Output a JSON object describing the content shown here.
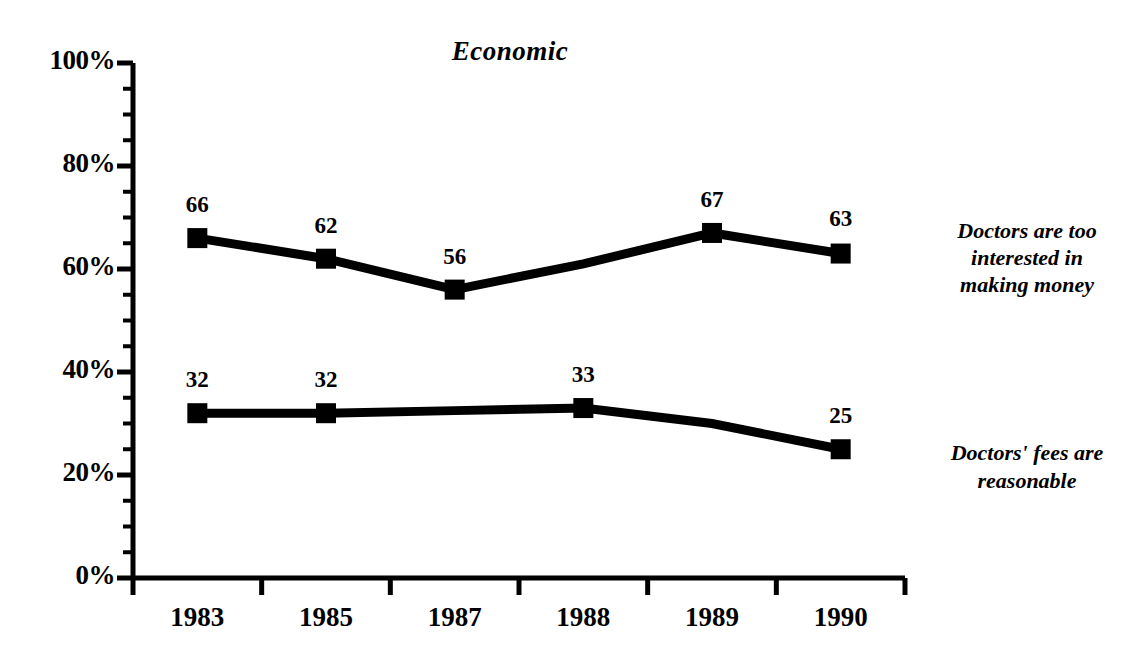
{
  "chart_data": {
    "type": "line",
    "title": "Economic",
    "xlabel": "",
    "ylabel": "",
    "categories": [
      "1983",
      "1985",
      "1987",
      "1988",
      "1989",
      "1990"
    ],
    "ylim": [
      0,
      100
    ],
    "yticks": [
      "0%",
      "20%",
      "40%",
      "60%",
      "80%",
      "100%"
    ],
    "ytick_values": [
      0,
      20,
      40,
      60,
      80,
      100
    ],
    "minor_tick_step": 5,
    "grid": false,
    "legend_position": "inline-right",
    "series": [
      {
        "name": "Doctors are too interested in making money",
        "label_lines": [
          "Doctors are too",
          "interested in",
          "making money"
        ],
        "values": [
          66,
          62,
          56,
          61,
          67,
          63
        ],
        "marker_years": [
          "1983",
          "1985",
          "1987",
          "1989",
          "1990"
        ],
        "point_labels": [
          {
            "year": "1983",
            "text": "66"
          },
          {
            "year": "1985",
            "text": "62"
          },
          {
            "year": "1987",
            "text": "56"
          },
          {
            "year": "1989",
            "text": "67"
          },
          {
            "year": "1990",
            "text": "63"
          }
        ]
      },
      {
        "name": "Doctors' fees are reasonable",
        "label_lines": [
          "Doctors' fees are",
          "reasonable"
        ],
        "values": [
          32,
          32,
          32.5,
          33,
          30,
          25
        ],
        "marker_years": [
          "1983",
          "1985",
          "1988",
          "1990"
        ],
        "point_labels": [
          {
            "year": "1983",
            "text": "32"
          },
          {
            "year": "1985",
            "text": "32"
          },
          {
            "year": "1988",
            "text": "33"
          },
          {
            "year": "1990",
            "text": "25"
          }
        ]
      }
    ],
    "colors": {
      "line": "#000000",
      "marker": "#000000",
      "axis": "#000000",
      "text": "#000000",
      "background": "#ffffff"
    }
  },
  "axis": {
    "y_labels": [
      "100%",
      "80%",
      "60%",
      "40%",
      "20%",
      "0%"
    ],
    "x_labels": [
      "1983",
      "1985",
      "1987",
      "1988",
      "1989",
      "1990"
    ]
  },
  "annotations": {
    "series1_line1": "Doctors are too",
    "series1_line2": "interested in",
    "series1_line3": "making money",
    "series2_line1": "Doctors' fees are",
    "series2_line2": "reasonable"
  },
  "point_labels": {
    "s1_1983": "66",
    "s1_1985": "62",
    "s1_1987": "56",
    "s1_1989": "67",
    "s1_1990": "63",
    "s2_1983": "32",
    "s2_1985": "32",
    "s2_1988": "33",
    "s2_1990": "25"
  }
}
